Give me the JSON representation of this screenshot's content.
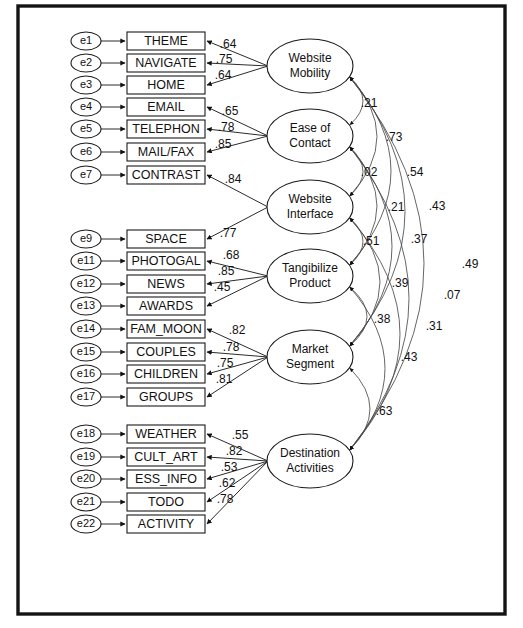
{
  "figure": {
    "type": "sem-path-diagram",
    "frame": {
      "x": 18,
      "y": 6,
      "width": 487,
      "height": 608
    }
  },
  "chart_data": {
    "type": "diagram",
    "notation": "AMOS-style measurement model with standardized loadings and factor correlations",
    "latent_factors": [
      {
        "id": "WM",
        "label_line1": "Website",
        "label_line2": "Mobility",
        "cx": 310,
        "cy": 66,
        "rx": 43,
        "ry": 27,
        "indicators": [
          "THEME",
          "NAVIGATE",
          "HOME"
        ],
        "loadings": [
          0.64,
          0.75,
          0.64
        ]
      },
      {
        "id": "EC",
        "label_line1": "Ease of",
        "label_line2": "Contact",
        "cx": 310,
        "cy": 136,
        "rx": 43,
        "ry": 27,
        "indicators": [
          "EMAIL",
          "TELEPHON",
          "MAIL/FAX"
        ],
        "loadings": [
          0.65,
          0.78,
          0.85
        ]
      },
      {
        "id": "WI",
        "label_line1": "Website",
        "label_line2": "Interface",
        "cx": 310,
        "cy": 207,
        "rx": 43,
        "ry": 27,
        "indicators": [
          "CONTRAST",
          "SPACE"
        ],
        "loadings": [
          0.84,
          0.77
        ]
      },
      {
        "id": "TP",
        "label_line1": "Tangibilize",
        "label_line2": "Product",
        "cx": 310,
        "cy": 276,
        "rx": 43,
        "ry": 27,
        "indicators": [
          "PHOTOGAL",
          "NEWS",
          "AWARDS"
        ],
        "loadings": [
          0.68,
          0.85,
          0.45
        ]
      },
      {
        "id": "MS",
        "label_line1": "Market",
        "label_line2": "Segment",
        "cx": 310,
        "cy": 357,
        "rx": 43,
        "ry": 27,
        "indicators": [
          "FAM_MOON",
          "COUPLES",
          "CHILDREN",
          "GROUPS"
        ],
        "loadings": [
          0.82,
          0.78,
          0.75,
          0.81
        ]
      },
      {
        "id": "DA",
        "label_line1": "Destination",
        "label_line2": "Activities",
        "cx": 310,
        "cy": 461,
        "rx": 43,
        "ry": 27,
        "indicators": [
          "WEATHER",
          "CULT_ART",
          "ESS_INFO",
          "TODO",
          "ACTIVITY"
        ],
        "loadings": [
          0.55,
          0.82,
          0.53,
          0.62,
          0.78
        ]
      }
    ],
    "observed_variables": [
      {
        "error": "e1",
        "name": "THEME",
        "y": 41,
        "factor": "WM",
        "loading": ".64",
        "label_x": 228,
        "label_y": 45
      },
      {
        "error": "e2",
        "name": "NAVIGATE",
        "y": 63,
        "factor": "WM",
        "loading": ".75",
        "label_x": 224,
        "label_y": 60
      },
      {
        "error": "e3",
        "name": "HOME",
        "y": 85,
        "factor": "WM",
        "loading": ".64",
        "label_x": 223,
        "label_y": 76
      },
      {
        "error": "e4",
        "name": "EMAIL",
        "y": 107,
        "factor": "EC",
        "loading": ".65",
        "label_x": 230,
        "label_y": 112
      },
      {
        "error": "e5",
        "name": "TELEPHON",
        "y": 129,
        "factor": "EC",
        "loading": ".78",
        "label_x": 226,
        "label_y": 128
      },
      {
        "error": "e6",
        "name": "MAIL/FAX",
        "y": 152,
        "factor": "EC",
        "loading": ".85",
        "label_x": 223,
        "label_y": 145
      },
      {
        "error": "e7",
        "name": "CONTRAST",
        "y": 175,
        "factor": "WI",
        "loading": ".84",
        "label_x": 233,
        "label_y": 180
      },
      {
        "error": "e9",
        "name": "SPACE",
        "y": 239,
        "factor": "WI",
        "loading": ".77",
        "label_x": 228,
        "label_y": 234
      },
      {
        "error": "e11",
        "name": "PHOTOGAL",
        "y": 261,
        "factor": "TP",
        "loading": ".68",
        "label_x": 231,
        "label_y": 256
      },
      {
        "error": "e12",
        "name": "NEWS",
        "y": 284,
        "factor": "TP",
        "loading": ".85",
        "label_x": 226,
        "label_y": 272
      },
      {
        "error": "e13",
        "name": "AWARDS",
        "y": 306,
        "factor": "TP",
        "loading": ".45",
        "label_x": 222,
        "label_y": 288
      },
      {
        "error": "e14",
        "name": "FAM_MOON",
        "y": 329,
        "factor": "MS",
        "loading": ".82",
        "label_x": 237,
        "label_y": 331
      },
      {
        "error": "e15",
        "name": "COUPLES",
        "y": 352,
        "factor": "MS",
        "loading": ".78",
        "label_x": 231,
        "label_y": 348
      },
      {
        "error": "e16",
        "name": "CHILDREN",
        "y": 374,
        "factor": "MS",
        "loading": ".75",
        "label_x": 225,
        "label_y": 364
      },
      {
        "error": "e17",
        "name": "GROUPS",
        "y": 397,
        "factor": "MS",
        "loading": ".81",
        "label_x": 224,
        "label_y": 380
      },
      {
        "error": "e18",
        "name": "WEATHER",
        "y": 434,
        "factor": "DA",
        "loading": ".55",
        "label_x": 240,
        "label_y": 436
      },
      {
        "error": "e19",
        "name": "CULT_ART",
        "y": 457,
        "factor": "DA",
        "loading": ".82",
        "label_x": 234,
        "label_y": 452
      },
      {
        "error": "e20",
        "name": "ESS_INFO",
        "y": 479,
        "factor": "DA",
        "loading": ".53",
        "label_x": 229,
        "label_y": 468
      },
      {
        "error": "e21",
        "name": "TODO",
        "y": 502,
        "factor": "DA",
        "loading": ".62",
        "label_x": 227,
        "label_y": 484
      },
      {
        "error": "e22",
        "name": "ACTIVITY",
        "y": 524,
        "factor": "DA",
        "loading": ".78",
        "label_x": 225,
        "label_y": 500
      }
    ],
    "correlations": [
      {
        "from": "WM",
        "to": "EC",
        "value": ".21",
        "label_x": 369,
        "label_y": 104,
        "bulge": 26
      },
      {
        "from": "EC",
        "to": "WI",
        "value": ".02",
        "label_x": 369,
        "label_y": 173,
        "bulge": 26
      },
      {
        "from": "WI",
        "to": "TP",
        "value": ".51",
        "label_x": 371,
        "label_y": 242,
        "bulge": 26
      },
      {
        "from": "TP",
        "to": "MS",
        "value": ".38",
        "label_x": 382,
        "label_y": 320,
        "bulge": 34
      },
      {
        "from": "MS",
        "to": "DA",
        "value": ".63",
        "label_x": 384,
        "label_y": 412,
        "bulge": 40
      },
      {
        "from": "WM",
        "to": "WI",
        "value": ".73",
        "label_x": 394,
        "label_y": 138,
        "bulge": 54
      },
      {
        "from": "EC",
        "to": "TP",
        "value": ".21",
        "label_x": 396,
        "label_y": 208,
        "bulge": 54
      },
      {
        "from": "WI",
        "to": "MS",
        "value": ".39",
        "label_x": 400,
        "label_y": 284,
        "bulge": 60
      },
      {
        "from": "TP",
        "to": "DA",
        "value": ".43",
        "label_x": 409,
        "label_y": 358,
        "bulge": 70
      },
      {
        "from": "WM",
        "to": "TP",
        "value": ".54",
        "label_x": 415,
        "label_y": 173,
        "bulge": 82
      },
      {
        "from": "EC",
        "to": "MS",
        "value": ".37",
        "label_x": 419,
        "label_y": 240,
        "bulge": 84
      },
      {
        "from": "WI",
        "to": "DA",
        "value": ".31",
        "label_x": 434,
        "label_y": 327,
        "bulge": 100
      },
      {
        "from": "WM",
        "to": "MS",
        "value": ".43",
        "label_x": 437,
        "label_y": 207,
        "bulge": 110
      },
      {
        "from": "EC",
        "to": "DA",
        "value": ".07",
        "label_x": 452,
        "label_y": 296,
        "bulge": 118
      },
      {
        "from": "WM",
        "to": "DA",
        "value": ".49",
        "label_x": 470,
        "label_y": 265,
        "bulge": 148
      }
    ]
  }
}
